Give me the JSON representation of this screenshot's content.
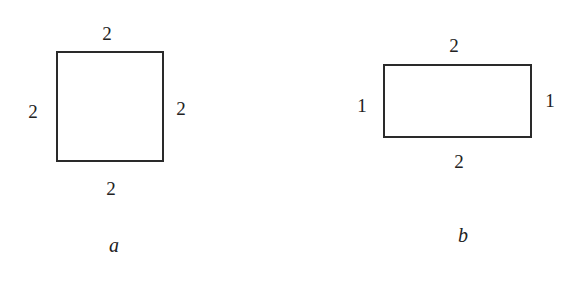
{
  "figures": [
    {
      "caption": "a",
      "shape": "square",
      "sides": {
        "top": "2",
        "left": "2",
        "right": "2",
        "bottom": "2"
      }
    },
    {
      "caption": "b",
      "shape": "rectangle",
      "sides": {
        "top": "2",
        "left": "1",
        "right": "1",
        "bottom": "2"
      }
    }
  ]
}
